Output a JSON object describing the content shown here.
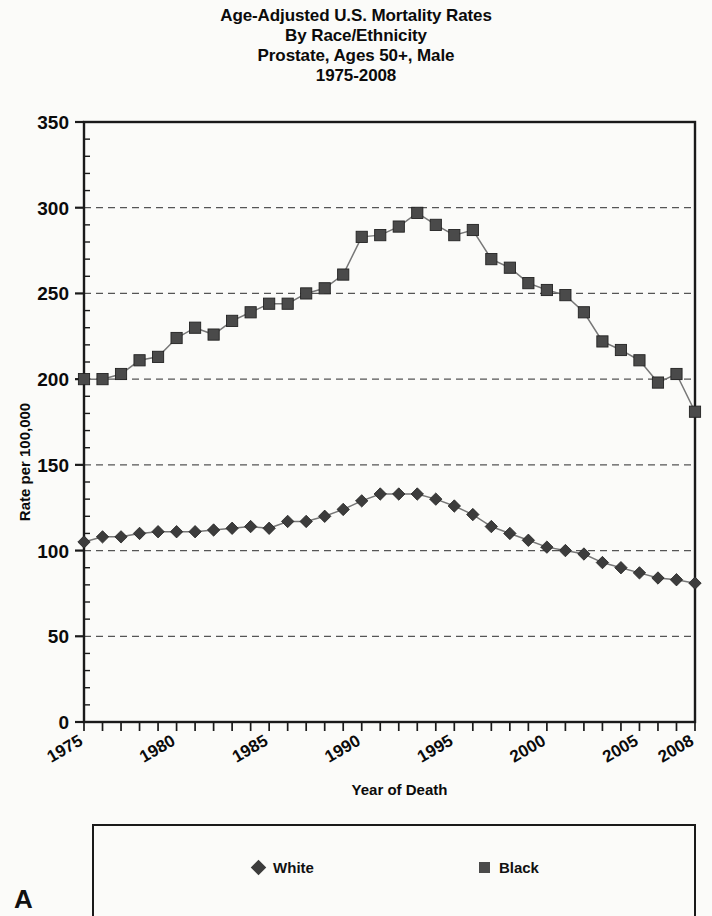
{
  "title": {
    "lines": [
      "Age-Adjusted U.S. Mortality Rates",
      "By Race/Ethnicity",
      "Prostate, Ages 50+, Male",
      "1975-2008"
    ]
  },
  "panel_label": "A",
  "legend": {
    "white_label": "White",
    "black_label": "Black",
    "white_marker": "diamond-marker-icon",
    "black_marker": "square-marker-icon"
  },
  "colors": {
    "white_series": "#3c3c3c",
    "black_series": "#4a4a4a",
    "axis": "#1a1a1a",
    "gridline": "#555555",
    "background": "#fbfbf9"
  },
  "chart_data": {
    "type": "line",
    "title": "Age-Adjusted U.S. Mortality Rates By Race/Ethnicity Prostate, Ages 50+, Male 1975-2008",
    "xlabel": "Year of Death",
    "ylabel": "Rate per 100,000",
    "xlim": [
      1975,
      2008
    ],
    "ylim": [
      0,
      350
    ],
    "ytick_labels": [
      "0",
      "50",
      "100",
      "150",
      "200",
      "250",
      "300",
      "350"
    ],
    "yticks": [
      0,
      50,
      100,
      150,
      200,
      250,
      300,
      350
    ],
    "ytick_interval": 50,
    "yminor_interval": 10,
    "xtick_labels": [
      "1975",
      "1980",
      "1985",
      "1990",
      "1995",
      "2000",
      "2005",
      "2008"
    ],
    "xticks": [
      1975,
      1980,
      1985,
      1990,
      1995,
      2000,
      2005,
      2008
    ],
    "xtick_label_rotation": -30,
    "grid": "horizontal-dashed",
    "legend_position": "bottom-box",
    "x": [
      1975,
      1976,
      1977,
      1978,
      1979,
      1980,
      1981,
      1982,
      1983,
      1984,
      1985,
      1986,
      1987,
      1988,
      1989,
      1990,
      1991,
      1992,
      1993,
      1994,
      1995,
      1996,
      1997,
      1998,
      1999,
      2000,
      2001,
      2002,
      2003,
      2004,
      2005,
      2006,
      2007,
      2008
    ],
    "series": [
      {
        "name": "White",
        "marker": "diamond",
        "values": [
          105,
          108,
          108,
          110,
          111,
          111,
          111,
          112,
          113,
          114,
          113,
          117,
          117,
          120,
          124,
          129,
          133,
          133,
          133,
          130,
          126,
          121,
          114,
          110,
          106,
          102,
          100,
          98,
          93,
          90,
          87,
          84,
          83,
          81
        ]
      },
      {
        "name": "Black",
        "marker": "square",
        "values": [
          200,
          200,
          203,
          211,
          213,
          224,
          230,
          226,
          234,
          239,
          244,
          244,
          250,
          253,
          261,
          283,
          284,
          289,
          297,
          290,
          284,
          287,
          270,
          265,
          256,
          252,
          249,
          239,
          222,
          217,
          211,
          198,
          203,
          181
        ]
      }
    ]
  }
}
